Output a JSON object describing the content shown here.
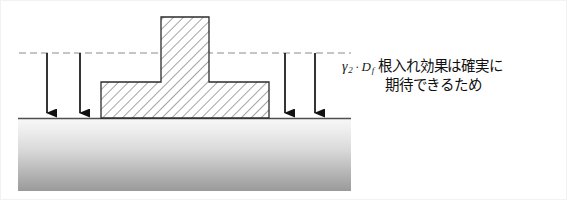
{
  "figure": {
    "background_color": "#ffffff",
    "border_color": "#f2f2f2"
  },
  "annotation": {
    "symbol_gamma": "γ",
    "symbol_gamma_subscript": "2",
    "operator_dot": "·",
    "symbol_depth": "D",
    "symbol_depth_subscript": "f",
    "text_line_1": "根入れ効果は確実に",
    "text_line_2": "期待できるため",
    "text_color": "#101010"
  },
  "ground": {
    "label": "soil-mass",
    "x": 17,
    "y": 117,
    "width": 333,
    "height": 73,
    "top_color": "#f7f7f7",
    "bottom_color": "#9a9a9a",
    "surface_line_color": "#5a5a5a"
  },
  "embedment_line": {
    "label": "embedment-depth-dashed-line",
    "y": 52,
    "x_start": 18,
    "x_end": 350,
    "color": "#8c8c8c",
    "dash_pattern": "7,4"
  },
  "footing": {
    "label": "T-shaped-spread-footing",
    "outline_color": "#2b2b2b",
    "hatch_color": "#555555",
    "fill_color": "#ffffff",
    "column": {
      "x": 160,
      "y": 16,
      "width": 48,
      "height": 65
    },
    "base": {
      "x": 100,
      "y": 81,
      "width": 168,
      "height": 36
    }
  },
  "load_arrows": {
    "label": "surcharge-load-arrows",
    "color": "#111111",
    "y_start": 52,
    "y_end": 117,
    "positions": [
      46,
      79,
      284,
      314
    ],
    "count": 4
  }
}
